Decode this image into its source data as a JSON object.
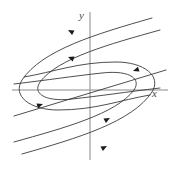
{
  "figure": {
    "background_color": "#ffffff",
    "axis_color": "#8a8a8a",
    "curve_color": "#3a3a3a",
    "arrow_color": "#1a1a1a",
    "label_color": "#4a4a4a"
  },
  "axes": {
    "x_label": "x",
    "y_label": "y",
    "origin": {
      "x": 90,
      "y": 90
    },
    "x_axis": {
      "x1": 12,
      "y1": 90,
      "x2": 168,
      "y2": 90
    },
    "y_axis": {
      "x1": 90,
      "y1": 12,
      "x2": 90,
      "y2": 160
    },
    "x_label_pos": {
      "x": 152,
      "y": 97
    },
    "y_label_pos": {
      "x": 79,
      "y": 19
    }
  },
  "chart_data": {
    "type": "line",
    "xlabel": "x",
    "ylabel": "y",
    "grid": false,
    "legend": "none",
    "equilibrium": {
      "x": 0,
      "y": 0,
      "kind": "degenerate-node"
    },
    "trajectories": [
      {
        "name": "left-parabola-outer",
        "opens": "left",
        "path": "M 152 18 C 96 34, 42 50, 22 80 C 12 96, 30 110, 58 110 C 96 110, 120 100, 150 95",
        "direction": "toward-origin"
      },
      {
        "name": "left-parabola-inner",
        "opens": "left",
        "path": "M 160 30 C 110 44, 58 58, 40 82 C 32 94, 46 102, 72 99 C 100 96, 126 92, 160 88",
        "direction": "toward-origin"
      },
      {
        "name": "right-parabola-outer",
        "opens": "right",
        "path": "M 22 154 C 78 138, 132 122, 152 92 C 162 76, 144 62, 116 62 C 78 62, 54 72, 24 77",
        "direction": "toward-origin"
      },
      {
        "name": "right-parabola-inner",
        "opens": "right",
        "path": "M 14 142 C 64 128, 116 114, 134 90 C 142 78, 128 70, 102 73 C 74 76, 48 80, 14 84",
        "direction": "toward-origin"
      }
    ],
    "separatrices": [
      {
        "name": "eigendirection-line",
        "path": "M 14 116 L 166 70",
        "slope_sign": "negative",
        "through_origin": true
      }
    ],
    "flow_arrows": [
      {
        "name": "arrow-upper-left-outer",
        "x": 68,
        "y": 30,
        "angle": 208,
        "toward": "origin"
      },
      {
        "name": "arrow-upper-left-inner",
        "x": 68,
        "y": 57,
        "angle": 200,
        "toward": "origin"
      },
      {
        "name": "arrow-left-separatrix",
        "x": 43,
        "y": 104,
        "angle": 342,
        "toward": "origin"
      },
      {
        "name": "arrow-right-separatrix",
        "x": 133,
        "y": 71,
        "angle": 162,
        "toward": "origin"
      },
      {
        "name": "arrow-lower-right-inner",
        "x": 110,
        "y": 118,
        "angle": 332,
        "toward": "origin"
      },
      {
        "name": "arrow-lower-right-outer",
        "x": 107,
        "y": 146,
        "angle": 332,
        "toward": "origin"
      }
    ]
  }
}
